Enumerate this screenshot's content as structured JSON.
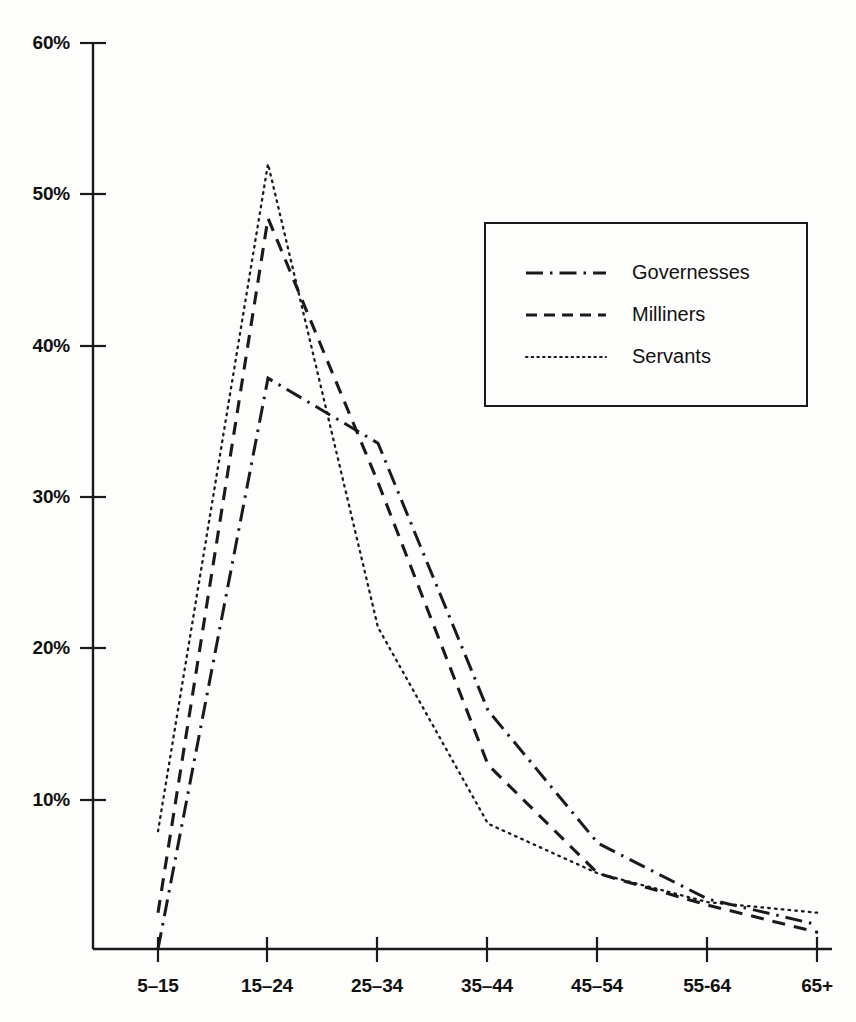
{
  "chart_data": {
    "type": "line",
    "title": "",
    "subtitle": "",
    "xlabel": "",
    "ylabel": "",
    "categories": [
      "5–15",
      "15–24",
      "25–34",
      "35–44",
      "45–54",
      "55-64",
      "65+"
    ],
    "ytick_labels": [
      "60%",
      "50%",
      "40%",
      "30%",
      "20%",
      "10%"
    ],
    "ytick_values": [
      60,
      50,
      40,
      30,
      20,
      10
    ],
    "ylim": [
      0,
      60
    ],
    "grid": false,
    "legend_position": "upper-right-inside",
    "series": [
      {
        "name": "Governesses",
        "style": "dash-dot",
        "values": [
          0.0,
          37.8,
          33.5,
          15.8,
          7.0,
          3.3,
          1.6
        ]
      },
      {
        "name": "Milliners",
        "style": "dashed",
        "values": [
          2.4,
          48.4,
          30.9,
          12.2,
          5.0,
          2.9,
          1.1
        ]
      },
      {
        "name": "Servants",
        "style": "dotted",
        "values": [
          7.8,
          52.0,
          21.3,
          8.3,
          5.0,
          3.1,
          2.4
        ]
      }
    ]
  },
  "legend": {
    "entries": [
      {
        "label": "Governesses",
        "style": "dash-dot"
      },
      {
        "label": "Milliners",
        "style": "dashed"
      },
      {
        "label": "Servants",
        "style": "dotted"
      }
    ]
  },
  "axes": {
    "y_ticks": [
      "60%",
      "50%",
      "40%",
      "30%",
      "20%",
      "10%"
    ],
    "x_ticks": [
      "5–15",
      "15–24",
      "25–34",
      "35–44",
      "45–54",
      "55-64",
      "65+"
    ]
  },
  "colors": {
    "line": "#1a1a1a",
    "axis": "#1a1a1a",
    "background": "#fdfdfc",
    "text": "#111111"
  }
}
